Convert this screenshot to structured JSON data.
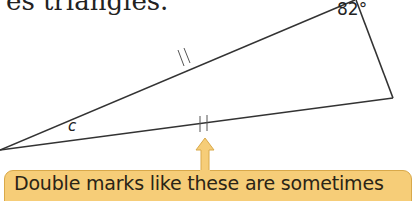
{
  "header_fragment": "es triangles.",
  "figure": {
    "angle_label": "82°",
    "side_label": "c",
    "line_color": "#333333"
  },
  "callout": {
    "text": "Double marks like these are sometimes",
    "fill": "#f6cd78",
    "border": "#d9a94a"
  }
}
